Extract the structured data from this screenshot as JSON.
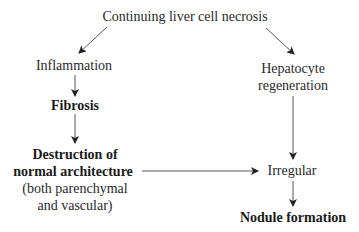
{
  "diagram": {
    "type": "flowchart",
    "nodes": {
      "top": "Continuing liver cell necrosis",
      "inflammation": "Inflammation",
      "fibrosis": "Fibrosis",
      "destruction_line1": "Destruction of",
      "destruction_line2": "normal architecture",
      "destruction_note1": "(both parenchymal",
      "destruction_note2": "and vascular)",
      "hepatocyte_line1": "Hepatocyte",
      "hepatocyte_line2": "regeneration",
      "irregular": "Irregular",
      "nodule": "Nodule formation"
    },
    "edges": [
      {
        "from": "Continuing liver cell necrosis",
        "to": "Inflammation"
      },
      {
        "from": "Continuing liver cell necrosis",
        "to": "Hepatocyte regeneration"
      },
      {
        "from": "Inflammation",
        "to": "Fibrosis"
      },
      {
        "from": "Fibrosis",
        "to": "Destruction of normal architecture"
      },
      {
        "from": "Destruction of normal architecture",
        "to": "Irregular"
      },
      {
        "from": "Hepatocyte regeneration",
        "to": "Irregular"
      },
      {
        "from": "Irregular",
        "to": "Nodule formation"
      }
    ],
    "colors": {
      "text": "#2a2a2a",
      "arrow": "#333333",
      "background": "#ffffff"
    }
  }
}
